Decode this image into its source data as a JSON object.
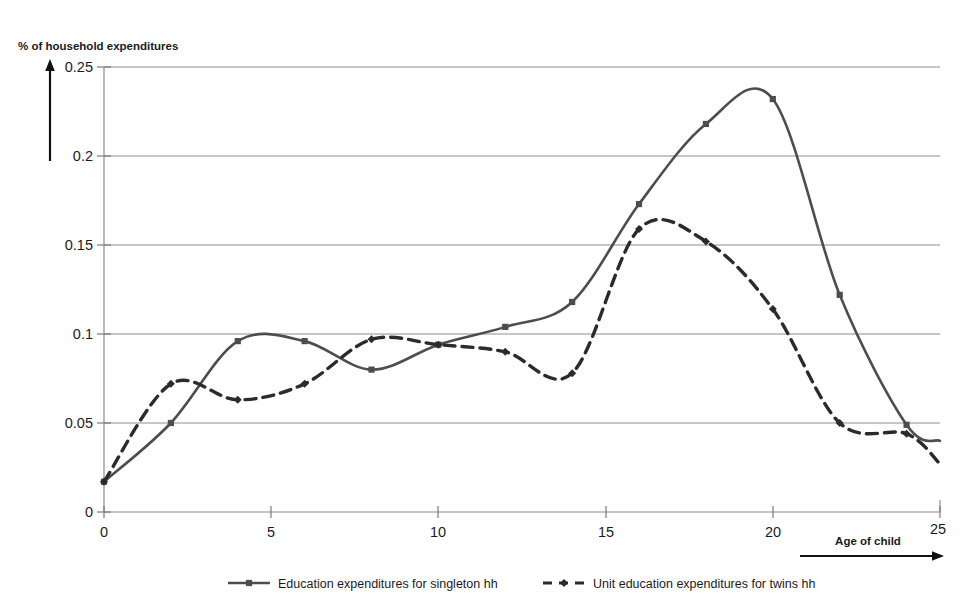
{
  "chart_data": {
    "type": "line",
    "title": "",
    "ylabel": "% of household expenditures",
    "xlabel": "Age of child",
    "xlim": [
      0,
      25
    ],
    "ylim": [
      0,
      0.25
    ],
    "grid": true,
    "legend_position": "bottom",
    "x_ticks": [
      "0",
      "5",
      "10",
      "15",
      "20",
      "25"
    ],
    "x_tick_values": [
      0,
      5,
      10,
      15,
      20,
      25
    ],
    "y_ticks": [
      "0",
      "0.05",
      "0.1",
      "0.15",
      "0.2",
      "0.25"
    ],
    "y_tick_values": [
      0,
      0.05,
      0.1,
      0.15,
      0.2,
      0.25
    ],
    "x": [
      0,
      2,
      4,
      6,
      8,
      10,
      12,
      14,
      16,
      18,
      20,
      22,
      24,
      25
    ],
    "series": [
      {
        "name": "Education expenditures for singleton hh",
        "style": "solid",
        "marker": "square",
        "color": "#4d4d4d",
        "values": [
          0.017,
          0.05,
          0.096,
          0.096,
          0.08,
          0.094,
          0.104,
          0.118,
          0.173,
          0.218,
          0.232,
          0.122,
          0.049,
          0.04
        ]
      },
      {
        "name": "Unit education expenditures for twins hh",
        "style": "dashed",
        "marker": "diamond",
        "color": "#2b2b2b",
        "values": [
          0.017,
          0.072,
          0.063,
          0.072,
          0.097,
          0.094,
          0.09,
          0.078,
          0.159,
          0.152,
          0.114,
          0.05,
          0.044,
          0.027
        ]
      }
    ],
    "annotations": {
      "y_axis_arrow": "upward-arrow",
      "x_axis_arrow": "rightward-arrow"
    }
  }
}
